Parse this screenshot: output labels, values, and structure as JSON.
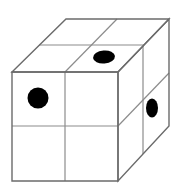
{
  "figure": {
    "kind": "isometric-cube-diagram",
    "canvas": {
      "width": 179,
      "height": 193
    },
    "colors": {
      "background": "#ffffff",
      "face": "#ffffff",
      "outline": "#6b6b6b",
      "inner_line": "#8c8c8c",
      "dot": "#000000"
    },
    "stroke": {
      "outline_width": 1.4,
      "inner_width": 1.2
    },
    "projection": {
      "description": "oblique parallel projection, depth toward upper-right",
      "depth_dx": 53,
      "depth_dy": -53
    },
    "geometry": {
      "front_face": {
        "name": "front-face",
        "top_left": [
          12,
          72
        ],
        "top_right": [
          118,
          72
        ],
        "bottom_right": [
          118,
          181
        ],
        "bottom_left": [
          12,
          181
        ],
        "divider_x": 65,
        "divider_y": 126
      },
      "top_face": {
        "name": "top-face",
        "front_left": [
          12,
          72
        ],
        "front_right": [
          118,
          72
        ],
        "back_right": [
          169,
          19
        ],
        "back_left": [
          66,
          19
        ],
        "divider_front": [
          65,
          72
        ],
        "divider_back": [
          117,
          19
        ],
        "mid_front_left": [
          39,
          45
        ],
        "mid_front_right": [
          144,
          45
        ]
      },
      "right_face": {
        "name": "right-face",
        "front_top": [
          118,
          72
        ],
        "back_top": [
          169,
          19
        ],
        "back_bottom": [
          169,
          126
        ],
        "front_bottom": [
          118,
          181
        ],
        "divider_top": [
          143,
          46
        ],
        "divider_bottom": [
          143,
          154
        ],
        "mid_top": [
          118,
          126
        ],
        "mid_bottom": [
          169,
          73
        ]
      }
    },
    "dots": [
      {
        "name": "dot-front-upper-left",
        "face": "front",
        "shape": "circle",
        "cx": 38,
        "cy": 98,
        "rx": 10.5,
        "ry": 10.5,
        "rotation": 0
      },
      {
        "name": "dot-top-front-right",
        "face": "top",
        "shape": "ellipse",
        "cx": 104,
        "cy": 57,
        "rx": 11,
        "ry": 6.5,
        "rotation": -5
      },
      {
        "name": "dot-right-upper-back",
        "face": "right",
        "shape": "ellipse",
        "cx": 152,
        "cy": 108,
        "rx": 6,
        "ry": 9.5,
        "rotation": 0
      }
    ]
  }
}
